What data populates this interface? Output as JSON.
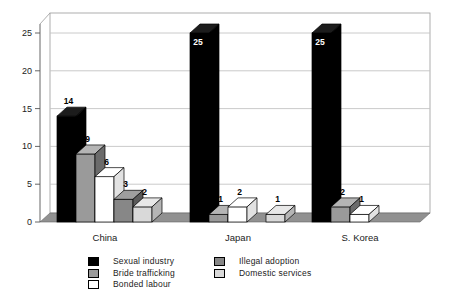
{
  "figure": {
    "background": "#ffffff"
  },
  "chart_data": {
    "type": "bar",
    "projection": "3d",
    "title": "",
    "categories": [
      "China",
      "Japan",
      "S. Korea"
    ],
    "y_axis": {
      "min": 0,
      "max": 25,
      "tick_step": 5,
      "ticks": [
        "0",
        "5",
        "10",
        "15",
        "20",
        "25"
      ],
      "gridlines": "horizontal"
    },
    "series": [
      {
        "name": "Sexual industry",
        "color": "#000000",
        "side_color": "#000000",
        "top_color": "#1c1c1c",
        "values": [
          14,
          25,
          25
        ]
      },
      {
        "name": "Bride trafficking",
        "color": "#9a9a9a",
        "side_color": "#6b6b6b",
        "top_color": "#b5b5b5",
        "values": [
          9,
          1,
          2
        ]
      },
      {
        "name": "Bonded labour",
        "color": "#ffffff",
        "side_color": "#e2e2e2",
        "top_color": "#ffffff",
        "values": [
          6,
          2,
          1
        ]
      },
      {
        "name": "Illegal adoption",
        "color": "#878787",
        "side_color": "#5a5a5a",
        "top_color": "#9e9e9e",
        "values": [
          3,
          0,
          0
        ]
      },
      {
        "name": "Domestic services",
        "color": "#d9d9d9",
        "side_color": "#b5b5b5",
        "top_color": "#e8e8e8",
        "values": [
          2,
          1,
          0
        ]
      }
    ],
    "bar_value_labels": {
      "shown": true,
      "inside_color": "#ffffff",
      "outside_color": "#000000",
      "note": "labels equal bar values; zero-value bars are not drawn"
    },
    "legend": {
      "position": "bottom",
      "column1": [
        "Sexual industry",
        "Bride trafficking",
        "Bonded labour"
      ],
      "column2": [
        "Illegal adoption",
        "Domestic services"
      ]
    },
    "colors": {
      "floor": "#919191",
      "wall": "#ffffff",
      "gridline": "#c4c4c4",
      "axis": "#555555"
    }
  }
}
